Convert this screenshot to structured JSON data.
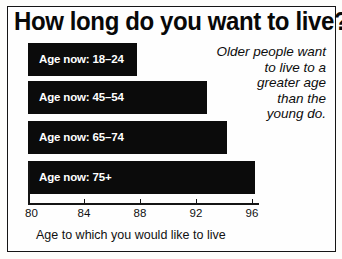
{
  "title": "How long do you want to live?",
  "annotation": {
    "lines": [
      "Older people want",
      "to live to a",
      "greater age",
      "than the",
      "young do."
    ]
  },
  "axis": {
    "caption": "Age to which you would like to live",
    "ticks": [
      "80",
      "84",
      "88",
      "92",
      "96"
    ]
  },
  "colors": {
    "bar": "#0b0b0b",
    "bar_label": "#ffffff",
    "background": "#fefefe",
    "ink": "#111111"
  },
  "chart_data": {
    "type": "bar",
    "orientation": "horizontal",
    "title": "How long do you want to live?",
    "xlabel": "Age to which you would like to live",
    "ylabel": "",
    "categories": [
      "Age now: 18–24",
      "Age now: 45–54",
      "Age now: 65–74",
      "Age now: 75+"
    ],
    "values": [
      87.8,
      92.8,
      94.2,
      96.2
    ],
    "xlim": [
      80,
      96.5
    ],
    "xticks": [
      80,
      84,
      88,
      92,
      96
    ],
    "grid": false,
    "legend": null,
    "annotations": [
      "Older people want to live to a greater age than the young do."
    ]
  }
}
